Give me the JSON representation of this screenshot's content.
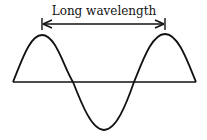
{
  "diagram": {
    "title": "Long wavelength",
    "elements": [
      "wave-curve",
      "baseline",
      "wavelength-arrow"
    ]
  }
}
